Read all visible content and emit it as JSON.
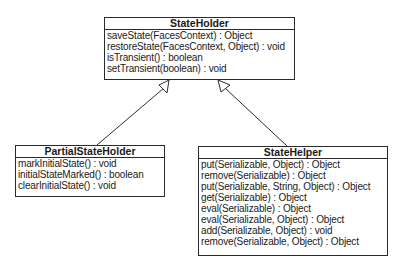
{
  "diagram": {
    "type": "UML class diagram",
    "classes": [
      {
        "id": "stateholder",
        "name": "StateHolder",
        "methods": [
          "saveState(FacesContext) : Object",
          "restoreState(FacesContext, Object) : void",
          "isTransient() : boolean",
          "setTransient(boolean) : void"
        ]
      },
      {
        "id": "partialstateholder",
        "name": "PartialStateHolder",
        "methods": [
          "markInitialState() : void",
          "initialStateMarked() : boolean",
          "clearInitialState() : void"
        ]
      },
      {
        "id": "statehelper",
        "name": "StateHelper",
        "methods": [
          "put(Serializable, Object) : Object",
          "remove(Serializable) : Object",
          "put(Serializable, String, Object) : Object",
          "get(Serializable) : Object",
          "eval(Serializable) : Object",
          "eval(Serializable, Object) : Object",
          "add(Serializable, Object) : void",
          "remove(Serializable, Object) : Object"
        ]
      }
    ],
    "relationships": [
      {
        "from": "PartialStateHolder",
        "to": "StateHolder",
        "type": "generalization"
      },
      {
        "from": "StateHelper",
        "to": "StateHolder",
        "type": "generalization"
      }
    ],
    "colors": {
      "line": "#2a2a2a",
      "background": "#ffffff",
      "text": "#1a1a1a"
    }
  }
}
